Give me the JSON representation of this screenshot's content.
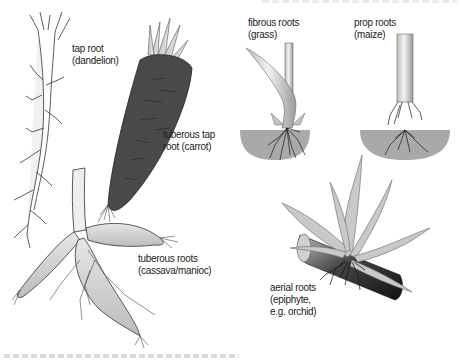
{
  "figure": {
    "specimens": [
      {
        "id": "tap-root",
        "label_line1": "tap root",
        "label_line2": "(dandelion)"
      },
      {
        "id": "tuberous-tap-root",
        "label_line1": "tuberous tap",
        "label_line2": "root (carrot)"
      },
      {
        "id": "tuberous-roots",
        "label_line1": "tuberous roots",
        "label_line2": "(cassava/manioc)"
      },
      {
        "id": "fibrous-roots",
        "label_line1": "fibrous roots",
        "label_line2": "(grass)"
      },
      {
        "id": "prop-roots",
        "label_line1": "prop roots",
        "label_line2": "(maize)"
      },
      {
        "id": "aerial-roots",
        "label_line1": "aerial roots",
        "label_line2": "(epiphyte,",
        "label_line3": "e.g. orchid)"
      }
    ],
    "colors": {
      "carrot_body": "#4a4a4a",
      "soil": "#a9a9a9",
      "stem_light": "#d4d4d4",
      "line_art": "#333333",
      "label_text": "#222222"
    }
  }
}
